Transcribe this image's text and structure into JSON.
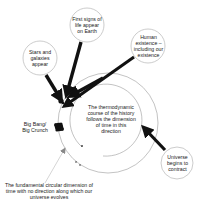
{
  "diagram": {
    "colors": {
      "stroke": "#9a9a9a",
      "arrow": "#111111",
      "text": "#222222",
      "background": "#ffffff"
    },
    "nodes": {
      "stars": {
        "label": "Stars and galaxies appear"
      },
      "life": {
        "label": "First signs of life appear on Earth"
      },
      "human": {
        "label": "Human existence – including our existence"
      },
      "contract": {
        "label": "Universe begins to contract"
      },
      "big_bang": {
        "label": "Big Bang/ Big Crunch"
      },
      "thermo": {
        "label": "The thermodynamic course of the history follows the dimension of time in this direction"
      },
      "fundamental": {
        "label": "The fundamental circular dimension of time with no direction along which our universe evolves"
      }
    }
  }
}
